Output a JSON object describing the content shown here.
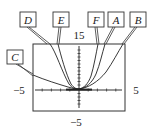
{
  "graph": {
    "window": {
      "xmin": -5,
      "xmax": 5,
      "ymin": -5,
      "ymax": 15
    },
    "tick_labels": {
      "top": "15",
      "bottom": "−5",
      "left": "−5",
      "right": "5"
    },
    "curve_labels": [
      {
        "id": "D",
        "label": "D"
      },
      {
        "id": "E",
        "label": "E"
      },
      {
        "id": "F",
        "label": "F"
      },
      {
        "id": "A",
        "label": "A"
      },
      {
        "id": "B",
        "label": "B"
      },
      {
        "id": "C",
        "label": "C"
      }
    ],
    "colors": {
      "ink": "#222222",
      "background": "#ffffff"
    }
  }
}
